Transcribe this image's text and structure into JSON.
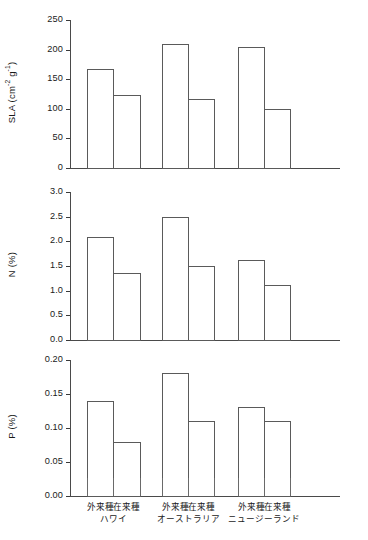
{
  "chart_data": {
    "type": "bar",
    "title": "",
    "xlabel": "",
    "grid": false,
    "legend": false,
    "categories": [
      "外来種",
      "在来種",
      "外来種",
      "在来種",
      "外来種",
      "在来種"
    ],
    "groups": [
      {
        "name": "ハワイ",
        "bars": [
          "外来種",
          "在来種"
        ]
      },
      {
        "name": "オーストラリア",
        "bars": [
          "外来種",
          "在来種"
        ]
      },
      {
        "name": "ニュージーランド",
        "bars": [
          "外来種",
          "在来種"
        ]
      }
    ],
    "panels": [
      {
        "id": "sla",
        "ylabel_main": "SLA (cm",
        "ylabel_sup1": "-2",
        "ylabel_mid": " g",
        "ylabel_sup2": "-1",
        "ylabel_end": ")",
        "ylabel_plain": "SLA (cm-2 g-1)",
        "ylim": [
          0,
          250
        ],
        "yticks": [
          0,
          50,
          100,
          150,
          200,
          250
        ],
        "ytick_labels": [
          "0",
          "50",
          "100",
          "150",
          "200",
          "250"
        ],
        "values": [
          167,
          123,
          210,
          116,
          205,
          99
        ],
        "series": [
          {
            "name": "外来種",
            "values": [
              167,
              210,
              205
            ]
          },
          {
            "name": "在来種",
            "values": [
              123,
              116,
              99
            ]
          }
        ]
      },
      {
        "id": "n",
        "ylabel_plain": "N (%)",
        "ylim": [
          0.0,
          3.0
        ],
        "yticks": [
          0.0,
          0.5,
          1.0,
          1.5,
          2.0,
          2.5,
          3.0
        ],
        "ytick_labels": [
          "0.0",
          "0.5",
          "1.0",
          "1.5",
          "2.0",
          "2.5",
          "3.0"
        ],
        "values": [
          2.09,
          1.36,
          2.5,
          1.5,
          1.62,
          1.12
        ],
        "series": [
          {
            "name": "外来種",
            "values": [
              2.09,
              2.5,
              1.62
            ]
          },
          {
            "name": "在来種",
            "values": [
              1.36,
              1.5,
              1.12
            ]
          }
        ]
      },
      {
        "id": "p",
        "ylabel_plain": "P (%)",
        "ylim": [
          0.0,
          0.2
        ],
        "yticks": [
          0.0,
          0.05,
          0.1,
          0.15,
          0.2
        ],
        "ytick_labels": [
          "0.00",
          "0.05",
          "0.10",
          "0.15",
          "0.20"
        ],
        "values": [
          0.14,
          0.08,
          0.181,
          0.11,
          0.131,
          0.111
        ],
        "series": [
          {
            "name": "外来種",
            "values": [
              0.14,
              0.181,
              0.131
            ]
          },
          {
            "name": "在来種",
            "values": [
              0.08,
              0.11,
              0.111
            ]
          }
        ]
      }
    ]
  }
}
